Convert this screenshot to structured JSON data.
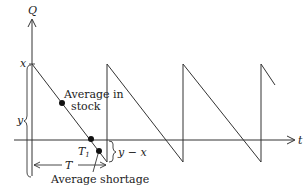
{
  "diagram": {
    "axes": {
      "y_label": "Q",
      "x_label": "t"
    },
    "labels": {
      "peak": "x",
      "height_brace": "y",
      "shortage_brace": "y − x",
      "period": "T",
      "stockout_time": "T",
      "stockout_subscript": "1",
      "average_in_stock_line1": "Average in",
      "average_in_stock_line2": "stock",
      "average_shortage": "Average shortage"
    },
    "colors": {
      "line": "#333333",
      "text": "#222222",
      "marker": "#111111",
      "background": "#ffffff"
    }
  }
}
